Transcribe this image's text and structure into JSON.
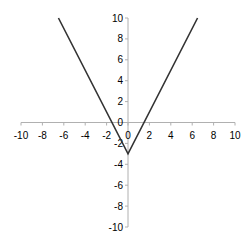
{
  "chart_data": {
    "type": "line",
    "title": "",
    "xlabel": "",
    "ylabel": "",
    "xlim": [
      -10,
      10
    ],
    "ylim": [
      -10,
      10
    ],
    "grid": false,
    "legend": null,
    "x_ticks": [
      -10,
      -8,
      -6,
      -4,
      -2,
      0,
      2,
      4,
      6,
      8,
      10
    ],
    "y_ticks": [
      -10,
      -8,
      -6,
      -4,
      -2,
      0,
      2,
      4,
      6,
      8,
      10
    ],
    "series": [
      {
        "name": "y = 2|x| - 3",
        "color": "#333333",
        "x": [
          -6.5,
          0,
          6.5
        ],
        "y": [
          10,
          -3,
          10
        ]
      }
    ]
  },
  "colors": {
    "axis": "#b0b0b0",
    "line": "#333333",
    "text": "#000000"
  }
}
